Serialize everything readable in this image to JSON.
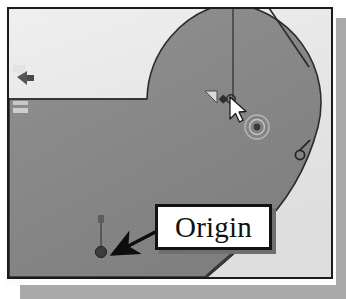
{
  "app": {
    "kind": "cad-sketch-viewport",
    "title": "CAD Sketch Viewport"
  },
  "callout": {
    "label": "Origin",
    "border_color": "#121212",
    "background_color": "#ffffff",
    "text_color": "#111111",
    "shadow_color": "#6f6f6f",
    "points_to": "origin-point-marker"
  },
  "viewport": {
    "background_color": "#e9e9e9",
    "border_color": "#1a1a1a",
    "shadow_color": "#a9a9a9",
    "shaded_face_color": "#8a8a8a",
    "light_face_color": "#e3e3e3",
    "edge_color": "#2b2b2b"
  },
  "geometry": {
    "description": "Shaded L-shaped profile with a large circular arc lobe at upper right",
    "arc_lobe": {
      "center_x": 216,
      "center_y": 98,
      "radius": 100
    },
    "horizontal_edge_y": 96,
    "vertical_construction_line_x": 224
  },
  "markers": {
    "origin_point": {
      "name": "origin-point-marker",
      "x": 95,
      "y": 246,
      "color": "#3c3c3c",
      "axis_tick_label": ""
    },
    "snap_target": {
      "name": "concentric-snap-marker",
      "x": 251,
      "y": 124,
      "color": "#6a6a6a"
    },
    "cursor": {
      "name": "mouse-cursor",
      "x": 228,
      "y": 97,
      "color": "#ffffff"
    }
  },
  "constraint_icons": [
    {
      "name": "constraint-icon-left-upper",
      "x": 14,
      "y": 73,
      "glyph": "fix"
    },
    {
      "name": "constraint-icon-left-lower",
      "x": 12,
      "y": 103,
      "glyph": "horizontal"
    },
    {
      "name": "constraint-icon-center",
      "x": 206,
      "y": 93,
      "glyph": "coincident"
    },
    {
      "name": "constraint-icon-right-edge",
      "x": 294,
      "y": 148,
      "glyph": "tangent"
    }
  ],
  "arrow": {
    "name": "callout-leader-arrow",
    "from_x": 158,
    "from_y": 223,
    "to_x": 104,
    "to_y": 250,
    "color": "#0d0d0d"
  }
}
